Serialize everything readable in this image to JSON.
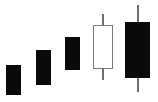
{
  "chart_data": {
    "type": "candlestick",
    "title": "",
    "subtitle": "",
    "xlabel": "",
    "ylabel": "",
    "grid": false,
    "legend": "none",
    "axis_visible": false,
    "background_color": "#ffffff",
    "bullish_color": "#ffffff",
    "bearish_color": "#0a0a0a",
    "outline_color": "#7a7a7a",
    "wick_color": "#6e6e6e",
    "categories": [
      "1",
      "2",
      "3",
      "4",
      "5"
    ],
    "series": [
      {
        "name": "price",
        "candles": [
          {
            "index": 1,
            "direction": "bearish",
            "fill": "filled",
            "open": 37,
            "high": 37,
            "low": 7,
            "close": 7,
            "has_upper_wick": false,
            "has_lower_wick": false,
            "px": {
              "x": 6,
              "width": 15,
              "body_top": 65,
              "body_bottom": 95,
              "wick_top": 65,
              "wick_bottom": 95
            }
          },
          {
            "index": 2,
            "direction": "bearish",
            "fill": "filled",
            "open": 52,
            "high": 52,
            "low": 17,
            "close": 17,
            "has_upper_wick": false,
            "has_lower_wick": false,
            "px": {
              "x": 36,
              "width": 15,
              "body_top": 50,
              "body_bottom": 85,
              "wick_top": 50,
              "wick_bottom": 85
            }
          },
          {
            "index": 3,
            "direction": "bearish",
            "fill": "filled",
            "open": 65,
            "high": 65,
            "low": 32,
            "close": 32,
            "has_upper_wick": false,
            "has_lower_wick": false,
            "px": {
              "x": 65,
              "width": 15,
              "body_top": 37,
              "body_bottom": 70,
              "wick_top": 37,
              "wick_bottom": 70
            }
          },
          {
            "index": 4,
            "direction": "bullish",
            "fill": "hollow",
            "open": 33,
            "high": 88,
            "low": 22,
            "close": 77,
            "has_upper_wick": true,
            "has_lower_wick": true,
            "px": {
              "x": 93,
              "width": 20,
              "body_top": 25,
              "body_bottom": 69,
              "wick_top": 14,
              "wick_bottom": 80
            }
          },
          {
            "index": 5,
            "direction": "bearish",
            "fill": "filled",
            "open": 80,
            "high": 97,
            "low": 10,
            "close": 24,
            "has_upper_wick": true,
            "has_lower_wick": true,
            "px": {
              "x": 125,
              "width": 25,
              "body_top": 22,
              "body_bottom": 78,
              "wick_top": 5,
              "wick_bottom": 92
            }
          }
        ]
      }
    ]
  },
  "chart": {
    "wick_width": 2,
    "width": 158,
    "height": 102
  }
}
